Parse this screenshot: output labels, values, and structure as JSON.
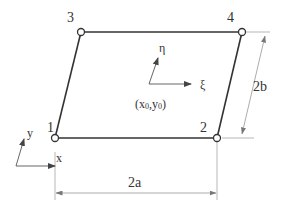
{
  "diagram": {
    "type": "parallelogram finite element with local and global coordinate systems",
    "colors": {
      "element_edge": "#333333",
      "dimension_line": "#888888",
      "axis": "#555555",
      "node_fill": "#ffffff",
      "text": "#333333"
    },
    "nodes": [
      {
        "id": "1",
        "label": "1"
      },
      {
        "id": "2",
        "label": "2"
      },
      {
        "id": "3",
        "label": "3"
      },
      {
        "id": "4",
        "label": "4"
      }
    ],
    "local_axes": {
      "xi_label": "ξ",
      "eta_label": "η",
      "origin_label_x": "(x",
      "origin_sub_x": "0",
      "origin_label_sep": ",y",
      "origin_sub_y": "0",
      "origin_label_close": ")"
    },
    "global_axes": {
      "x_label": "x",
      "y_label": "y"
    },
    "dimensions": {
      "width_label": "2a",
      "height_label": "2b"
    }
  }
}
